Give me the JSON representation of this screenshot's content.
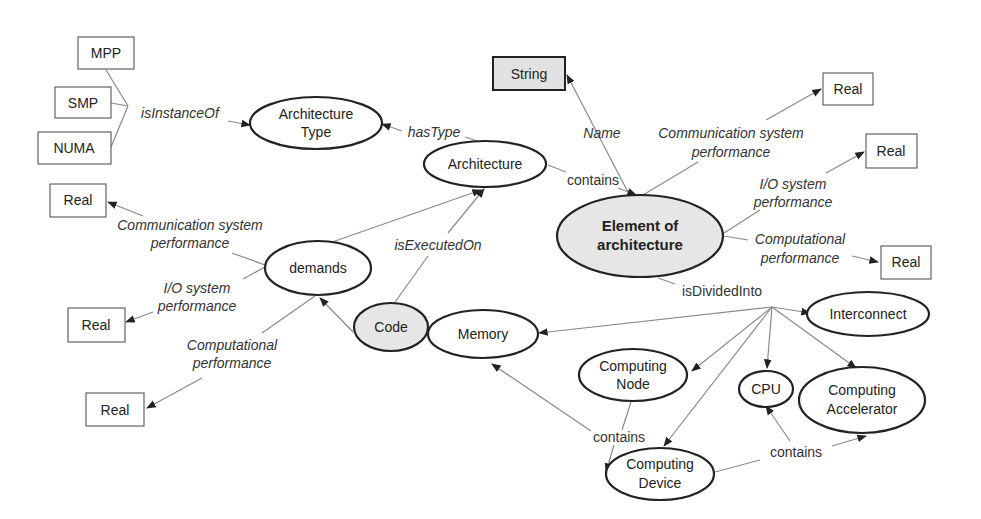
{
  "diagram": {
    "nodes": {
      "mpp": "MPP",
      "smp": "SMP",
      "numa": "NUMA",
      "architecture_type": [
        "Architecture",
        "Type"
      ],
      "string": "String",
      "architecture": "Architecture",
      "element_of_architecture": [
        "Element of",
        "architecture"
      ],
      "real_top_right": "Real",
      "real_mid_right": "Real",
      "real_low_right": "Real",
      "real_left_1": "Real",
      "real_left_2": "Real",
      "real_left_3": "Real",
      "demands": "demands",
      "code": "Code",
      "memory": "Memory",
      "interconnect": "Interconnect",
      "computing_node": [
        "Computing",
        "Node"
      ],
      "cpu": "CPU",
      "computing_accelerator": [
        "Computing",
        "Accelerator"
      ],
      "computing_device": [
        "Computing",
        "Device"
      ]
    },
    "edges": {
      "is_instance_of": "isInstanceOf",
      "has_type": "hasType",
      "name": "Name",
      "contains_arch": "contains",
      "comm_perf_right": [
        "Communication system",
        "performance"
      ],
      "io_perf_right": [
        "I/O system",
        "performance"
      ],
      "comp_perf_right": [
        "Computational",
        "performance"
      ],
      "is_divided_into": "isDividedInto",
      "comm_perf_left": [
        "Communication system",
        "performance"
      ],
      "io_perf_left": [
        "I/O system",
        "performance"
      ],
      "comp_perf_left": [
        "Computational",
        "performance"
      ],
      "is_executed_on": "isExecutedOn",
      "contains_node": "contains",
      "contains_device": "contains"
    }
  }
}
